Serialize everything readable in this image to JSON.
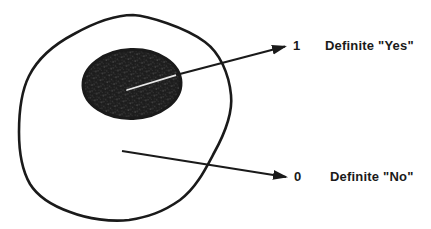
{
  "diagram": {
    "labels": {
      "yes_value": "1",
      "yes_text": "Definite \"Yes\"",
      "no_value": "0",
      "no_text": "Definite \"No\""
    },
    "colors": {
      "ink": "#1a1a1a",
      "background": "#ffffff",
      "subset_fill_base": "#1d1d1d"
    }
  }
}
